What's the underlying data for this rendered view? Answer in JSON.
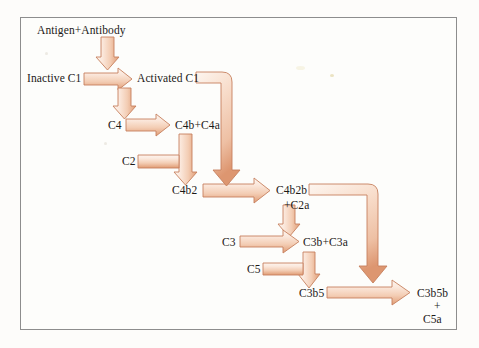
{
  "figure": {
    "title_text": "Classical complement pathway cascade",
    "background_color": "#fdfcfa",
    "panel_color": "#fdfdfb",
    "border_color": "#8d8d8d",
    "arrow_fill_light": "#faf0e8",
    "arrow_fill_mid": "#f0c3aa",
    "arrow_fill_dark": "#d98e6a",
    "arrow_outline": "#c6805e",
    "text_color": "#1c1a18"
  },
  "nodes": [
    {
      "id": "antigen_antibody",
      "label": "Antigen+Antibody",
      "x": 37,
      "y": 24
    },
    {
      "id": "inactive_c1",
      "label": "Inactive C1",
      "x": 27,
      "y": 72
    },
    {
      "id": "activated_c1",
      "label": "Activated C1",
      "x": 137,
      "y": 72
    },
    {
      "id": "c4",
      "label": "C4",
      "x": 108,
      "y": 121
    },
    {
      "id": "c4b_c4a",
      "label": "C4b+C4a",
      "x": 175,
      "y": 121
    },
    {
      "id": "c2",
      "label": "C2",
      "x": 122,
      "y": 158
    },
    {
      "id": "c4b2",
      "label": "C4b2",
      "x": 175,
      "y": 187
    },
    {
      "id": "c4b2b",
      "label": "C4b2b",
      "x": 277,
      "y": 187
    },
    {
      "id": "plus_c2a",
      "label": "+C2a",
      "x": 285,
      "y": 201
    },
    {
      "id": "c3",
      "label": "C3",
      "x": 222,
      "y": 238
    },
    {
      "id": "c3b_c3a",
      "label": "C3b+C3a",
      "x": 305,
      "y": 238
    },
    {
      "id": "c5",
      "label": "C5",
      "x": 247,
      "y": 266
    },
    {
      "id": "c3b5",
      "label": "C3b5",
      "x": 301,
      "y": 291
    },
    {
      "id": "c3b5b_c5a_line1",
      "label": "C3b5b",
      "x": 420,
      "y": 291
    },
    {
      "id": "c3b5b_c5a_line2",
      "label": "+",
      "x": 436,
      "y": 304
    },
    {
      "id": "c3b5b_c5a_line3",
      "label": "C5a",
      "x": 425,
      "y": 317
    }
  ],
  "edges": [
    {
      "id": "edge-antigen-to-inactive-c1",
      "from": "Antigen+Antibody",
      "to": "Inactive C1",
      "shape": "vertical-down"
    },
    {
      "id": "edge-inactive-to-activated-c1",
      "from": "Inactive C1",
      "to": "Activated C1",
      "shape": "horizontal-right"
    },
    {
      "id": "edge-activated-c1-to-c4",
      "from": "Activated C1",
      "to": "C4",
      "shape": "vertical-down"
    },
    {
      "id": "edge-c4-to-c4b-c4a",
      "from": "C4",
      "to": "C4b+C4a",
      "shape": "horizontal-right"
    },
    {
      "id": "edge-c4b-c4a-to-c4b2",
      "from": "C4b+C4a",
      "to": "C4b2",
      "shape": "vertical-down"
    },
    {
      "id": "edge-c2-to-c4b2",
      "from": "C2",
      "to": "C4b2",
      "shape": "elbow-right-down"
    },
    {
      "id": "edge-c4b2-to-c4b2b",
      "from": "C4b2",
      "to": "C4b2b",
      "shape": "horizontal-right"
    },
    {
      "id": "edge-activated-c1-to-c4b2b",
      "from": "Activated C1",
      "to": "C4b2b",
      "shape": "elbow-right-down-long"
    },
    {
      "id": "edge-c4b2b-to-c3",
      "from": "C4b2b",
      "to": "C3b+C3a",
      "shape": "vertical-down"
    },
    {
      "id": "edge-c3-to-c3b-c3a",
      "from": "C3",
      "to": "C3b+C3a",
      "shape": "horizontal-right"
    },
    {
      "id": "edge-c3b-c3a-to-c3b5",
      "from": "C3b+C3a",
      "to": "C3b5",
      "shape": "vertical-down"
    },
    {
      "id": "edge-c5-to-c3b5",
      "from": "C5",
      "to": "C3b5",
      "shape": "elbow-right-down"
    },
    {
      "id": "edge-c3b5-to-c3b5b",
      "from": "C3b5",
      "to": "C3b5b+C5a",
      "shape": "horizontal-right"
    },
    {
      "id": "edge-c4b2b-to-c3b5b",
      "from": "C4b2b",
      "to": "C3b5b+C5a",
      "shape": "elbow-right-down-long"
    }
  ]
}
